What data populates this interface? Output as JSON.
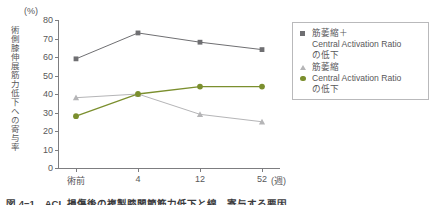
{
  "chart_data": {
    "type": "line",
    "title": "",
    "xlabel": "(週)",
    "ylabel": "術側膝伸展筋力低下への寄与率",
    "yunit": "(%)",
    "categories": [
      "術前",
      "4",
      "12",
      "52"
    ],
    "xtick_labels": [
      "術前",
      "4",
      "12",
      "52"
    ],
    "x_unit_label": "(週)",
    "ytick_labels": [
      "80",
      "70",
      "60",
      "50",
      "40",
      "30",
      "20",
      "10",
      "0"
    ],
    "ylim": [
      0,
      80
    ],
    "ytick_step": 10,
    "grid": false,
    "legend_position": "right",
    "series": [
      {
        "name": "筋萎縮＋Central Activation Ratioの低下",
        "marker": "square",
        "color": "#6f6f72",
        "values": [
          59,
          73,
          68,
          64
        ]
      },
      {
        "name": "筋萎縮",
        "marker": "triangle",
        "color": "#b5b5b7",
        "values": [
          38,
          40,
          29,
          25
        ]
      },
      {
        "name": "Central Activation Ratioの低下",
        "marker": "circle",
        "color": "#7b8f2e",
        "values": [
          28,
          40,
          44,
          44
        ]
      }
    ]
  },
  "legend": {
    "entries": [
      {
        "marker": "square-marker",
        "line1": "筋萎縮＋",
        "line2": "Central Activation Ratio",
        "line3": "の低下"
      },
      {
        "marker": "triangle-marker",
        "line1": "筋萎縮",
        "line2": "",
        "line3": ""
      },
      {
        "marker": "circle-marker",
        "line1": "Central Activation Ratio",
        "line2": "の低下",
        "line3": ""
      }
    ]
  },
  "caption": {
    "text": "図 4−1　ACL 損傷後の複製膝関節筋力低下と線　寄与する要因"
  }
}
